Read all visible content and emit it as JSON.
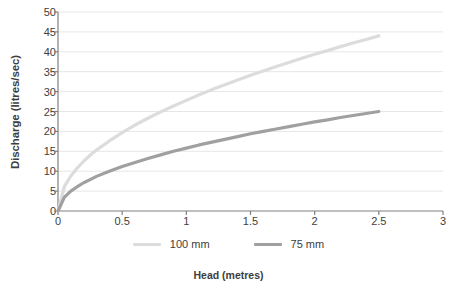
{
  "chart_data": {
    "type": "line",
    "title": "",
    "xlabel": "Head (metres)",
    "ylabel": "Discharge (litres/sec)",
    "xlim": [
      0,
      3
    ],
    "ylim": [
      0,
      50
    ],
    "xticks": [
      "0",
      "0.5",
      "1",
      "1.5",
      "2",
      "2.5",
      "3"
    ],
    "xtick_values": [
      0,
      0.5,
      1,
      1.5,
      2,
      2.5,
      3
    ],
    "yticks": [
      "0",
      "5",
      "10",
      "15",
      "20",
      "25",
      "30",
      "35",
      "40",
      "45",
      "50"
    ],
    "ytick_values": [
      0,
      5,
      10,
      15,
      20,
      25,
      30,
      35,
      40,
      45,
      50
    ],
    "grid": "horizontal",
    "grid_color": "#e6e6e6",
    "legend_position": "bottom",
    "x": [
      0,
      0.05,
      0.1,
      0.15,
      0.2,
      0.25,
      0.3,
      0.4,
      0.5,
      0.6,
      0.7,
      0.8,
      0.9,
      1.0,
      1.1,
      1.2,
      1.3,
      1.4,
      1.5,
      1.6,
      1.7,
      1.8,
      1.9,
      2.0,
      2.1,
      2.2,
      2.3,
      2.4,
      2.5
    ],
    "series": [
      {
        "name": "100 mm",
        "color": "#dcdcdc",
        "values": [
          0,
          6.2,
          8.8,
          10.8,
          12.5,
          14.0,
          15.3,
          17.6,
          19.7,
          21.6,
          23.3,
          24.9,
          26.4,
          27.8,
          29.2,
          30.5,
          31.7,
          32.9,
          34.1,
          35.2,
          36.3,
          37.3,
          38.4,
          39.4,
          40.3,
          41.3,
          42.2,
          43.1,
          44.0
        ],
        "endpoint": {
          "x": 2.5,
          "y": 44.0
        }
      },
      {
        "name": "75 mm",
        "color": "#a0a0a0",
        "values": [
          0,
          3.5,
          5.0,
          6.1,
          7.1,
          7.9,
          8.7,
          10.0,
          11.2,
          12.2,
          13.2,
          14.1,
          15.0,
          15.8,
          16.6,
          17.3,
          18.0,
          18.7,
          19.4,
          20.0,
          20.6,
          21.2,
          21.8,
          22.4,
          22.9,
          23.5,
          24.0,
          24.5,
          25.0
        ],
        "endpoint": {
          "x": 2.5,
          "y": 25.0
        }
      }
    ]
  },
  "legend": {
    "items": [
      {
        "label": "100 mm",
        "color": "#dcdcdc"
      },
      {
        "label": "75 mm",
        "color": "#a0a0a0"
      }
    ]
  },
  "axes": {
    "axis_color": "#808080",
    "text_color": "#3d3d3d"
  }
}
